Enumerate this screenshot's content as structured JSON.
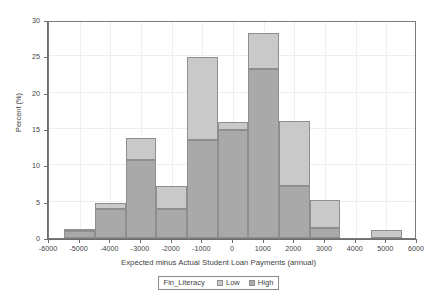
{
  "chart_data": {
    "type": "bar",
    "subtype": "stacked-histogram",
    "title": "",
    "xlabel": "Expected minus Actual Student Loan Payments (annual)",
    "ylabel": "Percent (%)",
    "xlim": [
      -6000,
      6000
    ],
    "ylim": [
      0,
      30
    ],
    "xticks": [
      -6000,
      -5000,
      -4000,
      -3000,
      -2000,
      -1000,
      0,
      1000,
      2000,
      3000,
      4000,
      5000,
      6000
    ],
    "xtick_labels": [
      "-6000",
      "-5000",
      "-4000",
      "-3000",
      "-2000",
      "-1000",
      "0",
      "1000",
      "2000",
      "3000",
      "4000",
      "5000",
      "6000"
    ],
    "yticks": [
      0,
      5,
      10,
      15,
      20,
      25,
      30
    ],
    "ytick_labels": [
      "0",
      "5",
      "10",
      "15",
      "20",
      "25",
      "30"
    ],
    "grid": true,
    "bin_width": 1000,
    "bin_edges": [
      -5500,
      -4500,
      -3500,
      -2500,
      -1500,
      -500,
      500,
      1500,
      2500,
      3500,
      4500,
      5500
    ],
    "bin_centers": [
      -5000,
      -4000,
      -3000,
      -2000,
      -1000,
      0,
      1000,
      2000,
      3000,
      4000,
      5000
    ],
    "series": [
      {
        "name": "High",
        "color": "#a9a9a9",
        "stack_order": 0,
        "values": [
          0.9,
          4.0,
          10.8,
          4.0,
          13.5,
          14.8,
          23.3,
          7.2,
          1.4,
          0.0,
          0.0
        ]
      },
      {
        "name": "Low",
        "color": "#c9c9c9",
        "stack_order": 1,
        "values": [
          0.4,
          0.8,
          2.9,
          3.2,
          11.4,
          1.2,
          4.9,
          8.9,
          3.8,
          0.0,
          1.1
        ]
      }
    ],
    "totals": [
      1.3,
      4.8,
      13.7,
      7.2,
      24.9,
      16.0,
      28.2,
      16.1,
      5.2,
      0.0,
      1.1
    ]
  },
  "legend": {
    "title": "Fin_Literacy",
    "position": "bottom-center",
    "entries": [
      {
        "label": "Low",
        "color": "#c9c9c9"
      },
      {
        "label": "High",
        "color": "#a9a9a9"
      }
    ]
  },
  "colors": {
    "low": "#c9c9c9",
    "high": "#a9a9a9",
    "bar_border": "#8e8e8e",
    "frame": "#7a7a7a",
    "grid": "#ededf2",
    "text": "#3f3f3f",
    "background": "#ffffff"
  }
}
